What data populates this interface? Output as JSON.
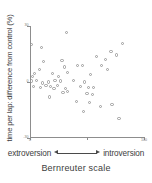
{
  "chart_data": {
    "type": "scatter",
    "title": "",
    "ylabel": "time per lap: difference from control (%)",
    "xlabel": "Bernreuter scale",
    "xlim": [
      0,
      100
    ],
    "ylim": [
      -30,
      30
    ],
    "grid": false,
    "legend": null,
    "y_ticks": [
      {
        "value": 30,
        "label": "30"
      },
      {
        "value": 0,
        "label": "0"
      },
      {
        "value": -30,
        "label": "-30"
      }
    ],
    "x_ticks": [
      {
        "value": 0,
        "label": "0"
      },
      {
        "value": 50,
        "label": ""
      },
      {
        "value": 100,
        "label": "100"
      }
    ],
    "marker": "open-circle",
    "marker_color": "#9a9a9a",
    "axis_color": "#8d8d8d",
    "points": [
      {
        "x": 1.0,
        "y": 20.0
      },
      {
        "x": 10.0,
        "y": 18.5
      },
      {
        "x": 32.0,
        "y": 26.5
      },
      {
        "x": 81.0,
        "y": 20.5
      },
      {
        "x": 71.0,
        "y": 16.5
      },
      {
        "x": 76.0,
        "y": 14.5
      },
      {
        "x": 58.0,
        "y": 13.5
      },
      {
        "x": 66.0,
        "y": 12.0
      },
      {
        "x": 12.0,
        "y": 11.0
      },
      {
        "x": 28.0,
        "y": 11.5
      },
      {
        "x": 30.0,
        "y": 8.0
      },
      {
        "x": 42.0,
        "y": 9.0
      },
      {
        "x": 46.0,
        "y": 9.0
      },
      {
        "x": 63.0,
        "y": 9.0
      },
      {
        "x": 8.0,
        "y": 6.5
      },
      {
        "x": 4.0,
        "y": 4.5
      },
      {
        "x": 2.0,
        "y": 3.0
      },
      {
        "x": 20.0,
        "y": 4.5
      },
      {
        "x": 25.0,
        "y": 3.0
      },
      {
        "x": 33.0,
        "y": 5.0
      },
      {
        "x": 53.0,
        "y": 4.0
      },
      {
        "x": 68.0,
        "y": 6.5
      },
      {
        "x": 1.5,
        "y": 0.5
      },
      {
        "x": 6.0,
        "y": 1.0
      },
      {
        "x": 11.0,
        "y": -0.5
      },
      {
        "x": 16.0,
        "y": 0.0
      },
      {
        "x": 22.0,
        "y": 1.0
      },
      {
        "x": 27.0,
        "y": 0.5
      },
      {
        "x": 38.0,
        "y": 1.0
      },
      {
        "x": 48.0,
        "y": 0.0
      },
      {
        "x": 3.0,
        "y": -2.5
      },
      {
        "x": 9.0,
        "y": -3.0
      },
      {
        "x": 14.0,
        "y": -2.0
      },
      {
        "x": 18.0,
        "y": -2.5
      },
      {
        "x": 21.0,
        "y": -3.5
      },
      {
        "x": 24.0,
        "y": -2.0
      },
      {
        "x": 31.0,
        "y": -3.5
      },
      {
        "x": 44.0,
        "y": -2.5
      },
      {
        "x": 51.0,
        "y": -3.0
      },
      {
        "x": 56.0,
        "y": -3.0
      },
      {
        "x": 29.0,
        "y": -5.5
      },
      {
        "x": 33.0,
        "y": -5.0
      },
      {
        "x": 50.0,
        "y": -6.0
      },
      {
        "x": 55.0,
        "y": -6.5
      },
      {
        "x": 17.0,
        "y": -8.0
      },
      {
        "x": 41.0,
        "y": -10.5
      },
      {
        "x": 52.0,
        "y": -11.0
      },
      {
        "x": 62.0,
        "y": -13.0
      },
      {
        "x": 72.0,
        "y": -12.0
      },
      {
        "x": 47.0,
        "y": -16.0
      },
      {
        "x": 78.0,
        "y": -19.5
      }
    ]
  },
  "annotations": {
    "left_label": "extroversion",
    "right_label": "introversion",
    "arrow": "double-headed-arrow"
  }
}
